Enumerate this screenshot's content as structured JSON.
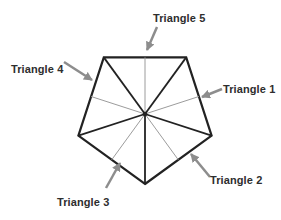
{
  "diagram": {
    "labels": {
      "triangle1": "Triangle 1",
      "triangle2": "Triangle 2",
      "triangle3": "Triangle 3",
      "triangle4": "Triangle 4",
      "triangle5": "Triangle 5"
    },
    "colors": {
      "background": "#ffffff",
      "outline": "#222222",
      "median": "#9c9c9c",
      "arrow": "#8d8d8d",
      "text": "#2e2e2e"
    }
  }
}
